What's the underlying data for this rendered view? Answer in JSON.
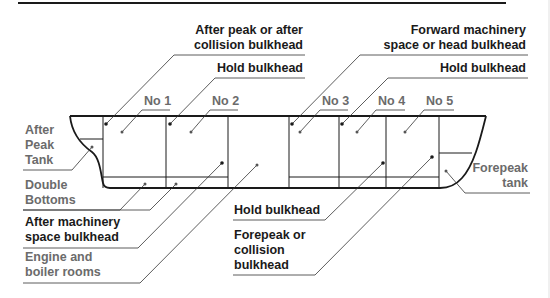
{
  "figure": {
    "type": "ship-compartment-diagram",
    "colors": {
      "line": "#1a1a1a",
      "leader": "#555555",
      "label_dark": "#1a1a1a",
      "label_grey": "#6b6b6b"
    }
  },
  "labels": {
    "after_peak_bulkhead": {
      "line1": "After peak or after",
      "line2": "collision bulkhead"
    },
    "hold_bulkhead_top_1": "Hold bulkhead",
    "forward_machinery": {
      "line1": "Forward machinery",
      "line2": "space or head bulkhead"
    },
    "hold_bulkhead_top_2": "Hold bulkhead",
    "holds": [
      "No 1",
      "No 2",
      "No 3",
      "No 4",
      "No 5"
    ],
    "after_peak_tank": {
      "line1": "After",
      "line2": "Peak",
      "line3": "Tank"
    },
    "double_bottoms": {
      "line1": "Double",
      "line2": "Bottoms"
    },
    "after_machinery": {
      "line1": "After machinery",
      "line2": "space bulkhead"
    },
    "engine_boiler": {
      "line1": "Engine and",
      "line2": "boiler rooms"
    },
    "hold_bulkhead_bottom": "Hold bulkhead",
    "forepeak_collision": {
      "line1": "Forepeak or",
      "line2": "collision",
      "line3": "bulkhead"
    },
    "forepeak_tank": {
      "line1": "Forepeak",
      "line2": "tank"
    }
  }
}
